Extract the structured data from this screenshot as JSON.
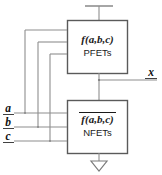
{
  "diagram": {
    "pullup": {
      "function_label": "f(a,b,c)",
      "device_label": "PFETs",
      "complemented": false
    },
    "pulldown": {
      "function_label": "f(a,b,c)",
      "device_label": "NFETs",
      "complemented": true
    },
    "inputs": [
      {
        "name": "input-a",
        "label": "a"
      },
      {
        "name": "input-b",
        "label": "b"
      },
      {
        "name": "input-c",
        "label": "c"
      }
    ],
    "output": {
      "name": "output-x",
      "label": "x"
    },
    "rails": {
      "supply_symbol": "vdd-bar",
      "ground_symbol": "ground-triangle"
    },
    "colors": {
      "wire": "#8e8e8e",
      "box_border": "#5a5a5a",
      "text": "#1a1a1a",
      "background": "#ffffff"
    }
  }
}
